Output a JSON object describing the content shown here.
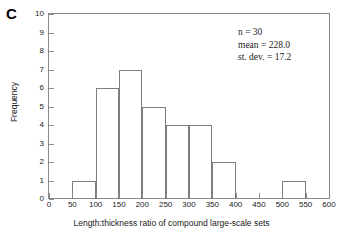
{
  "panel": {
    "label": "C"
  },
  "annotations": {
    "n_label": "n = 30",
    "mean_label": "mean = 228.0",
    "sd_label": "st. dev. = 17.2"
  },
  "axes": {
    "y_ticks": [
      "0",
      "1",
      "2",
      "3",
      "4",
      "5",
      "6",
      "7",
      "8",
      "9",
      "10"
    ],
    "x_ticks": [
      "0",
      "50",
      "100",
      "150",
      "200",
      "250",
      "300",
      "350",
      "400",
      "450",
      "500",
      "550",
      "600"
    ]
  },
  "style": {
    "axis_color": "#8a8a8a",
    "bar_outline": "#7d7d7d",
    "bar_fill": "none",
    "text_color": "#1a1a1a",
    "background": "#ffffff"
  },
  "chart_data": {
    "type": "bar",
    "title": "",
    "subtitle": "",
    "xlabel": "Length:thickness ratio of compound large-scale sets",
    "ylabel": "Frequency",
    "xlim": [
      0,
      600
    ],
    "ylim": [
      0,
      10
    ],
    "xtick_step": 50,
    "ytick_step": 1,
    "grid": false,
    "legend": null,
    "bin_width": 50,
    "bin_edges": [
      0,
      50,
      100,
      150,
      200,
      250,
      300,
      350,
      400,
      450,
      500,
      550,
      600
    ],
    "categories": [
      "0-50",
      "50-100",
      "100-150",
      "150-200",
      "200-250",
      "250-300",
      "300-350",
      "350-400",
      "400-450",
      "450-500",
      "500-550",
      "550-600"
    ],
    "values": [
      0,
      1,
      6,
      7,
      5,
      4,
      4,
      2,
      0,
      0,
      1,
      0
    ],
    "bars": [
      {
        "x0": 50,
        "x1": 100,
        "value": 1
      },
      {
        "x0": 100,
        "x1": 150,
        "value": 6
      },
      {
        "x0": 150,
        "x1": 200,
        "value": 7
      },
      {
        "x0": 200,
        "x1": 250,
        "value": 5
      },
      {
        "x0": 250,
        "x1": 300,
        "value": 4
      },
      {
        "x0": 300,
        "x1": 350,
        "value": 4
      },
      {
        "x0": 350,
        "x1": 400,
        "value": 2
      },
      {
        "x0": 500,
        "x1": 550,
        "value": 1
      }
    ],
    "annotations": [
      "n = 30",
      "mean = 228.0",
      "st. dev. = 17.2"
    ],
    "n": 30,
    "mean": 228.0,
    "std_dev": 17.2
  }
}
